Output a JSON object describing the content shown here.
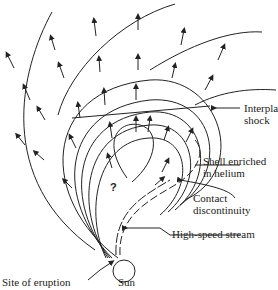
{
  "diagram": {
    "title": "",
    "labels": {
      "interplanetary_shock": [
        "Interplanetary",
        "shock"
      ],
      "shell_helium": [
        "Shell enriched",
        "in helium"
      ],
      "contact_discontinuity": [
        "Contact",
        "discontinuity"
      ],
      "high_speed_stream": "High-speed stream",
      "site_of_eruption": "Site of eruption",
      "sun": "Sun",
      "unknown": "?"
    },
    "colors": {
      "line": "#222222",
      "background": "#ffffff"
    }
  }
}
